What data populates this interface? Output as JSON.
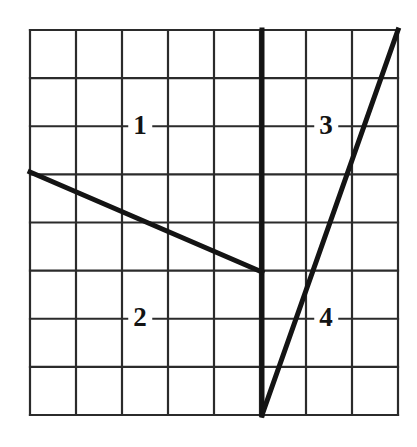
{
  "figure": {
    "type": "quadrant-grid-diagram",
    "background_color": "#ffffff",
    "ink_color": "#1a1a1a",
    "grid": {
      "columns": 8,
      "rows": 8,
      "left": 30,
      "top": 30,
      "right": 398,
      "bottom": 415,
      "cell_width": 46,
      "cell_height": 48.125,
      "line_width": 2.2,
      "line_color": "#2b2b2b"
    },
    "axis": {
      "name": "vertical-divider",
      "x": 262,
      "y_top": 30,
      "y_bottom": 415,
      "line_width": 5,
      "line_color": "#141414"
    },
    "lines": [
      {
        "name": "descending-segment",
        "x1": 30,
        "y1": 172,
        "x2": 262,
        "y2": 272,
        "line_width": 5,
        "line_color": "#141414"
      },
      {
        "name": "ascending-segment",
        "x1": 262,
        "y1": 415,
        "x2": 398,
        "y2": 30,
        "line_width": 5,
        "line_color": "#141414"
      }
    ],
    "labels": [
      {
        "id": "quadrant-1",
        "text": "1",
        "x": 140,
        "y": 126
      },
      {
        "id": "quadrant-3",
        "text": "3",
        "x": 326,
        "y": 126
      },
      {
        "id": "quadrant-2",
        "text": "2",
        "x": 140,
        "y": 318
      },
      {
        "id": "quadrant-4",
        "text": "4",
        "x": 326,
        "y": 318
      }
    ]
  }
}
